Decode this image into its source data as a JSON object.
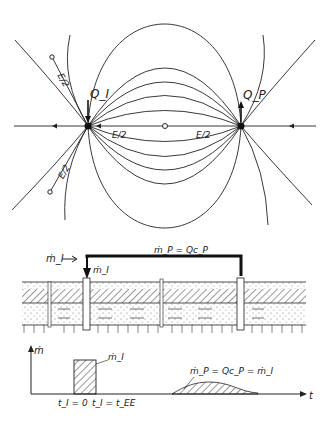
{
  "flow_net": {
    "injection_well_label": "Q_I",
    "production_well_label": "Q_P",
    "half_spacing_labels": [
      "E/2",
      "E/2",
      "E/2",
      "E/2"
    ],
    "wells": [
      {
        "name": "injection",
        "x": 88,
        "y": 126
      },
      {
        "name": "production",
        "x": 241,
        "y": 126
      }
    ],
    "midpoint": {
      "x": 165,
      "y": 126
    }
  },
  "cross_section": {
    "injected_rate_label": "ṁ_I",
    "injected_arrow_label": "ṁ_I",
    "pipe_label": "ṁ_P = Qc_P",
    "layers": [
      "top soil",
      "hatched confining layer",
      "aquifer (dotted)",
      "base"
    ]
  },
  "time_plot": {
    "y_axis_label": "ṁ",
    "x_axis_label": "t",
    "pulse_label": "ṁ_I",
    "response_label": "ṁ_P = Qc_P = ṁ_I",
    "tick_start": "t_I = 0",
    "tick_end": "t_I = t_EE"
  },
  "colors": {
    "ink": "#222222",
    "background": "#ffffff"
  }
}
